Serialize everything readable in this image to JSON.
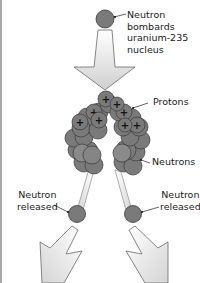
{
  "diagram": {
    "labels": {
      "incoming_line1": "Neutron",
      "incoming_line2": "bombards",
      "incoming_line3": "uranium-235",
      "incoming_line4": "nucleus",
      "protons": "Protons",
      "neutrons": "Neutrons",
      "released_left_line1": "Neutron",
      "released_left_line2": "released",
      "released_right_line1": "Neutron",
      "released_right_line2": "released"
    },
    "proton_symbol": "+",
    "colors": {
      "particle": "#7a7a7a",
      "particle_outline": "#3a3a3a",
      "arrow_fill": "#d8d8d8",
      "arrow_outline": "#6a6a6a",
      "border": "#a8a8a8"
    }
  }
}
